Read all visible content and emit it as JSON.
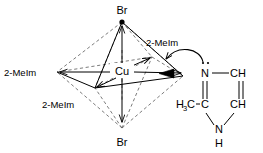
{
  "figure": {
    "name": "copper-bromide-2-methylimidazole-octahedral-complex"
  },
  "complex": {
    "metal_label": "Cu",
    "axial_top_label": "Br",
    "axial_bottom_label": "Br",
    "ligand_left_label": "2-MeIm",
    "ligand_lower_left_label": "2-MeIm",
    "ligand_upper_right_label": "2-MeIm",
    "geometry": "octahedral",
    "bond_style_solid": "front edges and metal-ligand bonds",
    "bond_style_dashed": "rear octahedron edges"
  },
  "ligand_molecule": {
    "name": "2-methylimidazole",
    "atoms": [
      {
        "id": "n3",
        "label": "N",
        "lone_pair": true
      },
      {
        "id": "c4",
        "label": "CH"
      },
      {
        "id": "c5",
        "label": "CH"
      },
      {
        "id": "n1",
        "label": "N"
      },
      {
        "id": "n1_h",
        "label": "H"
      },
      {
        "id": "c2",
        "label": "C"
      },
      {
        "id": "methyl",
        "label": "H3C",
        "sub_main": "H",
        "sub_index": "3",
        "sub_tail": "C"
      }
    ],
    "bonds": [
      {
        "from": "n3",
        "to": "c4",
        "order": 1
      },
      {
        "from": "c4",
        "to": "c5",
        "order": 2
      },
      {
        "from": "c5",
        "to": "n1",
        "order": 1
      },
      {
        "from": "n1",
        "to": "c2",
        "order": 1
      },
      {
        "from": "c2",
        "to": "n3",
        "order": 2
      },
      {
        "from": "methyl",
        "to": "c2",
        "order": 1
      }
    ]
  },
  "annotations": {
    "curved_arrow_label": "lone-pair donation arrow",
    "wedge_label": "coordinate bond arrowhead at copper"
  },
  "colors": {
    "stroke": "#000000",
    "dashed_stroke": "#5a5a5a",
    "background": "#ffffff",
    "text": "#000000"
  }
}
